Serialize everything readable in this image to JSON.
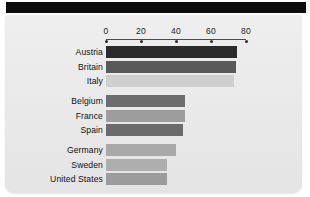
{
  "figure": {
    "background_color": "#ebebeb",
    "banner_color": "#0c0c0c",
    "banner_name": "top-black-banner"
  },
  "chart_data": {
    "type": "bar",
    "orientation": "horizontal",
    "title": "",
    "subtitle": "",
    "xlabel": "",
    "ylabel": "",
    "xlim": [
      0,
      80
    ],
    "xticks": [
      0,
      20,
      40,
      60,
      80
    ],
    "xtick_labels": [
      "0",
      "20",
      "40",
      "60",
      "80"
    ],
    "grid": false,
    "legend": "none",
    "categories": [
      "Austria",
      "Britain",
      "Italy",
      "Belgium",
      "France",
      "Spain",
      "Germany",
      "Sweden",
      "United States",
      "Netherlands"
    ],
    "values": [
      75,
      74,
      73,
      45,
      45,
      44,
      40,
      35,
      35,
      26
    ],
    "bar_colors": [
      "#2b2b2b",
      "#595959",
      "#cfcfcf",
      "#6d6d6d",
      "#9d9d9d",
      "#6b6b6b",
      "#a9a9a9",
      "#aeaeae",
      "#9c9c9c",
      "#262626"
    ],
    "groups": [
      {
        "name": "group-1",
        "categories": [
          "Austria",
          "Britain",
          "Italy"
        ]
      },
      {
        "name": "group-2",
        "categories": [
          "Belgium",
          "France",
          "Spain"
        ]
      },
      {
        "name": "group-3",
        "categories": [
          "Germany",
          "Sweden",
          "United States"
        ]
      },
      {
        "name": "group-4",
        "categories": [
          "Netherlands"
        ]
      }
    ]
  }
}
